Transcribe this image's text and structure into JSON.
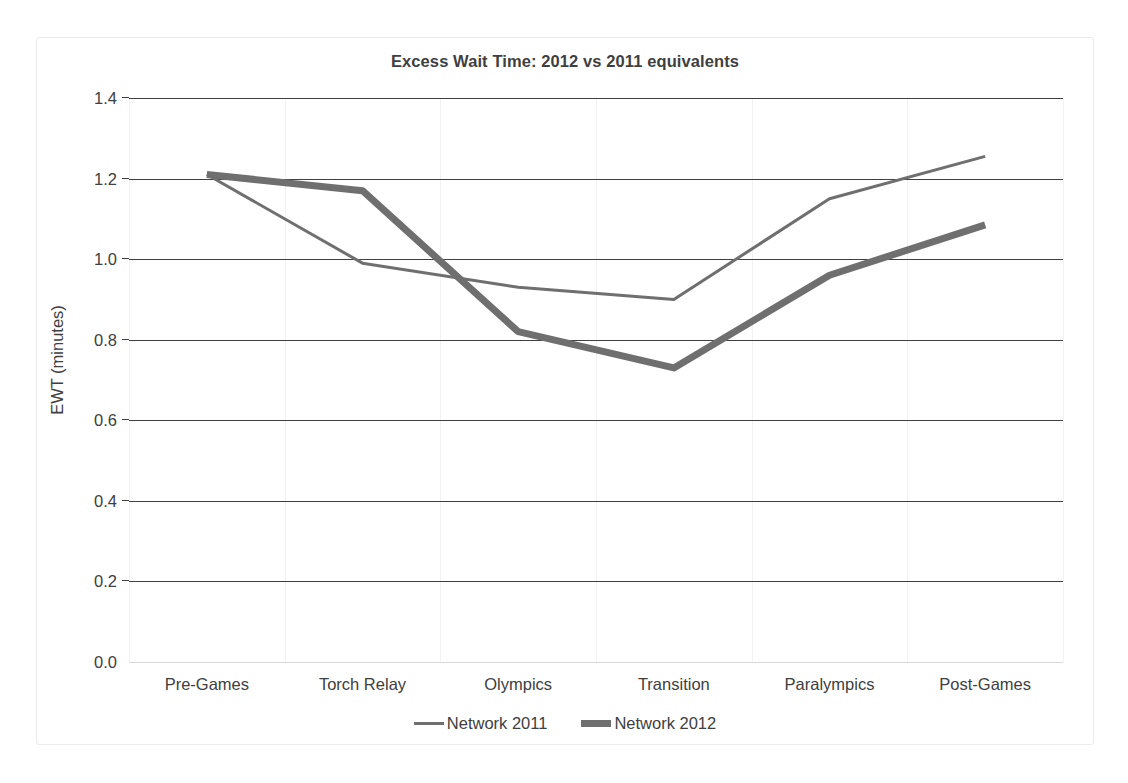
{
  "chart_data": {
    "type": "line",
    "title": "Excess Wait Time: 2012 vs 2011 equivalents",
    "xlabel": "",
    "ylabel": "EWT (minutes)",
    "categories": [
      "Pre-Games",
      "Torch Relay",
      "Olympics",
      "Transition",
      "Paralympics",
      "Post-Games"
    ],
    "ylim": [
      0.0,
      1.4
    ],
    "ytick_labels": [
      "0.0",
      "0.2",
      "0.4",
      "0.6",
      "0.8",
      "1.0",
      "1.2",
      "1.4"
    ],
    "yticks": [
      0.0,
      0.2,
      0.4,
      0.6,
      0.8,
      1.0,
      1.2,
      1.4
    ],
    "grid": "horizontal-major",
    "legend_position": "bottom",
    "series": [
      {
        "name": "Network 2011",
        "values": [
          1.21,
          0.99,
          0.93,
          0.9,
          1.15,
          1.255
        ],
        "color": "#6f6f6f",
        "line_width": 3
      },
      {
        "name": "Network 2012",
        "values": [
          1.21,
          1.17,
          0.82,
          0.73,
          0.96,
          1.085
        ],
        "color": "#6f6f6f",
        "line_width": 7
      }
    ]
  },
  "legend": {
    "items": [
      {
        "label": "Network 2011",
        "marker": "thin-line-swatch"
      },
      {
        "label": "Network 2012",
        "marker": "thick-line-swatch"
      }
    ]
  }
}
